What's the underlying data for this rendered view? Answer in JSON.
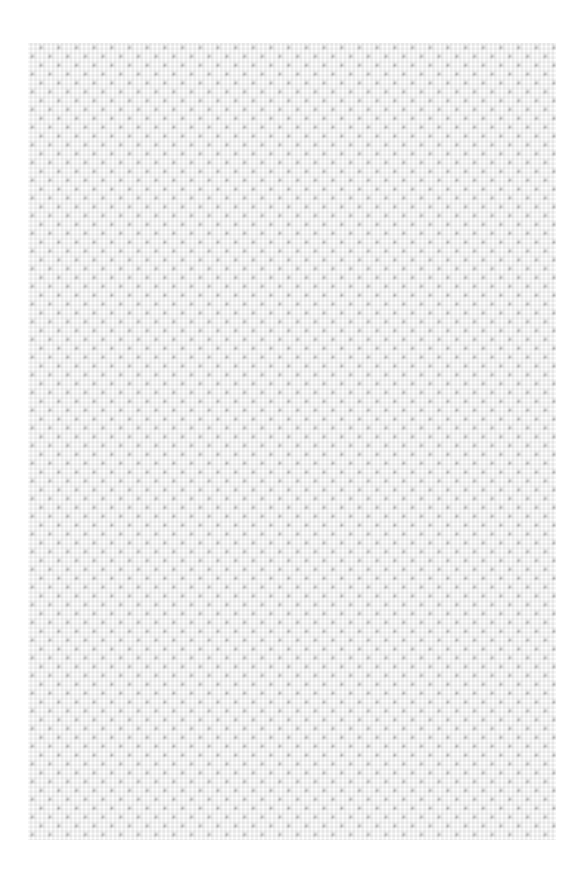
{
  "page": {
    "width": 584,
    "height": 879,
    "background_color": "#ffffff"
  },
  "swatch": {
    "label": "geometric-gingham-pattern-swatch",
    "x": 28,
    "y": 43,
    "width": 528,
    "height": 797,
    "base_color": "#dcdcdc",
    "mesh_color": "#ededed",
    "mid_diamond_color": "#a9a9a9",
    "dark_diamond_color": "#6e6e6e",
    "dot_color": "#ffffff",
    "tile_period_px": 17.7,
    "dot_diameter_px": 7,
    "motif": "diagonal lattice of dark diamonds alternating with white circles over a light checkerboard mesh"
  },
  "chart_data": {
    "type": "heatmap",
    "title": "",
    "xlabel": "",
    "ylabel": "",
    "grid": true,
    "legend": "none",
    "tile_period_px": 17.7,
    "columns": 30,
    "rows": 45,
    "palette": [
      "#ffffff",
      "#dcdcdc",
      "#a9a9a9",
      "#6e6e6e"
    ],
    "motif_elements": [
      {
        "name": "dark-diamond",
        "color": "#6e6e6e",
        "offset_x": 0.0,
        "offset_y": 0.0,
        "size_px": 17.7
      },
      {
        "name": "dark-diamond-offset",
        "color": "#6e6e6e",
        "offset_x": 8.85,
        "offset_y": 8.85,
        "size_px": 17.7
      },
      {
        "name": "mid-diamond",
        "color": "#a9a9a9",
        "offset_x": 4.4,
        "offset_y": 13.3,
        "size_px": 17.7
      },
      {
        "name": "mid-diamond-offset",
        "color": "#a9a9a9",
        "offset_x": 13.3,
        "offset_y": 4.4,
        "size_px": 17.7
      },
      {
        "name": "white-dot",
        "color": "#ffffff",
        "offset_x": 4.42,
        "offset_y": 4.42,
        "size_px": 7
      },
      {
        "name": "white-dot-offset",
        "color": "#ffffff",
        "offset_x": 13.27,
        "offset_y": 13.27,
        "size_px": 7
      }
    ]
  }
}
